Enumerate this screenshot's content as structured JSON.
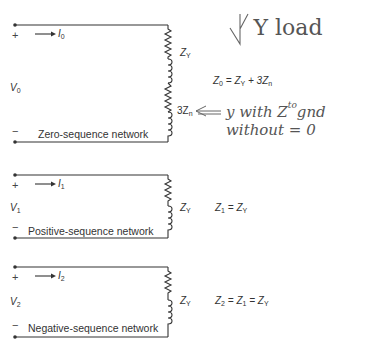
{
  "diagram": {
    "zero_sequence": {
      "plus": "+",
      "minus": "−",
      "current_symbol": "I",
      "current_sub": "0",
      "voltage_symbol": "V",
      "voltage_sub": "0",
      "network_label": "Zero-sequence network",
      "impedance_upper": {
        "sym": "Z",
        "sub": "Y"
      },
      "impedance_lower": {
        "prefix": "3Z",
        "sub": "n"
      },
      "equation": {
        "lhs": "Z",
        "lhs_sub": "0",
        "eq": " = Z",
        "t1_sub": "Y",
        "plus": " + 3Z",
        "t2_sub": "n"
      }
    },
    "positive_sequence": {
      "plus": "+",
      "minus": "−",
      "current_symbol": "I",
      "current_sub": "1",
      "voltage_symbol": "V",
      "voltage_sub": "1",
      "network_label": "Positive-sequence network",
      "impedance": {
        "sym": "Z",
        "sub": "Y"
      },
      "equation": {
        "lhs": "Z",
        "lhs_sub": "1",
        "eq": " = Z",
        "rhs_sub": "Y"
      }
    },
    "negative_sequence": {
      "plus": "+",
      "minus": "−",
      "current_symbol": "I",
      "current_sub": "2",
      "voltage_symbol": "V",
      "voltage_sub": "2",
      "network_label": "Negative-sequence network",
      "impedance": {
        "sym": "Z",
        "sub": "Y"
      },
      "equation": {
        "lhs": "Z",
        "lhs_sub": "2",
        "eq1": " = Z",
        "mid_sub": "1",
        "eq2": " = Z",
        "rhs_sub": "Y"
      }
    },
    "handwritten_notes": {
      "title": "Y load",
      "note_line1": "y with Z",
      "note_sup": "to",
      "note_gnd": "gnd",
      "note_line2": "without = 0"
    }
  }
}
